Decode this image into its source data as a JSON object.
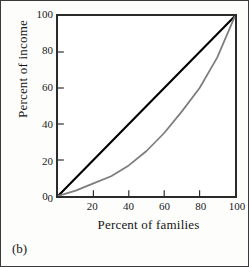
{
  "figure": {
    "panel_label": "(b)",
    "frame_color": "#3a3a3a",
    "background": "#ffffff"
  },
  "chart_data": {
    "type": "line",
    "title": "",
    "subtitle": "",
    "xlabel": "Percent of families",
    "ylabel": "Percent of income",
    "xlim": [
      0,
      100
    ],
    "ylim": [
      0,
      100
    ],
    "xticks": [
      0,
      20,
      40,
      60,
      80,
      100
    ],
    "yticks": [
      0,
      20,
      40,
      60,
      80,
      100
    ],
    "xtick_labels": [
      "0",
      "20",
      "40",
      "60",
      "80",
      "100"
    ],
    "ytick_labels": [
      "0",
      "20",
      "40",
      "60",
      "80",
      "100"
    ],
    "grid": false,
    "legend": "none",
    "annotations": [
      "(b)"
    ],
    "series": [
      {
        "name": "line of equality",
        "color": "#000000",
        "width": 2.2,
        "x": [
          0,
          100
        ],
        "values": [
          0,
          100
        ]
      },
      {
        "name": "Lorenz curve",
        "color": "#7d7d7d",
        "width": 1.8,
        "x": [
          0,
          10,
          20,
          30,
          40,
          50,
          60,
          70,
          80,
          90,
          100
        ],
        "values": [
          0,
          3,
          7,
          11,
          17,
          25,
          35,
          47,
          60,
          77,
          100
        ]
      }
    ]
  },
  "axes": {
    "x_title": "Percent of families",
    "y_title": "Percent of income",
    "tick_color": "#2b2b2b",
    "axis_color": "#2b2b2b"
  }
}
